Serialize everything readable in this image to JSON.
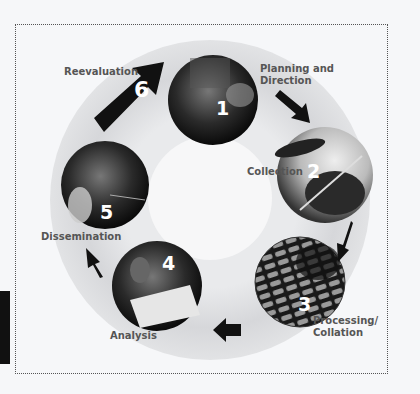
{
  "diagram": {
    "type": "cycle",
    "title": "",
    "steps": [
      {
        "number": "1",
        "label": "Planning and\nDirection",
        "label_line1": "Planning and",
        "label_line2": "Direction"
      },
      {
        "number": "2",
        "label": "Collection"
      },
      {
        "number": "3",
        "label": "Processing/\nCollation",
        "label_line1": "Processing/",
        "label_line2": "Collation"
      },
      {
        "number": "4",
        "label": "Analysis"
      },
      {
        "number": "5",
        "label": "Dissemination"
      },
      {
        "number": "6",
        "label": "Reevaluation"
      }
    ],
    "colors": {
      "background": "#f6f7f9",
      "ring": "#dcdde0",
      "arrow": "#111111",
      "label": "#555555",
      "number": "#ffffff"
    }
  }
}
